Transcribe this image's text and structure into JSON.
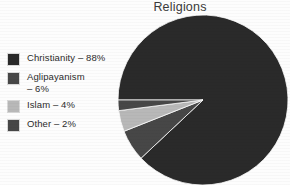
{
  "chart_data": {
    "type": "pie",
    "title": "Religions",
    "xlabel": "",
    "ylabel": "",
    "legend_position": "left",
    "grid": false,
    "categories": [
      "Christianity",
      "Aglipayanism",
      "Islam",
      "Other"
    ],
    "values": [
      88,
      6,
      4,
      2
    ],
    "unit": "%",
    "start_angle_deg": 180,
    "direction": "clockwise",
    "colors": [
      "#2a2a2a",
      "#474747",
      "#b8b8b8",
      "#474747"
    ],
    "labels": [
      "Christianity – 88%",
      "Aglipayanism\n– 6%",
      "Islam – 4%",
      "Other – 2%"
    ]
  },
  "legend": {
    "items": [
      {
        "label": "Christianity – 88%",
        "color": "#2a2a2a"
      },
      {
        "label": "Aglipayanism\n– 6%",
        "color": "#474747"
      },
      {
        "label": "Islam – 4%",
        "color": "#b8b8b8"
      },
      {
        "label": "Other – 2%",
        "color": "#474747"
      }
    ]
  },
  "figure": {
    "background": "#fdfdfd",
    "title_color": "#3a3a3a"
  }
}
